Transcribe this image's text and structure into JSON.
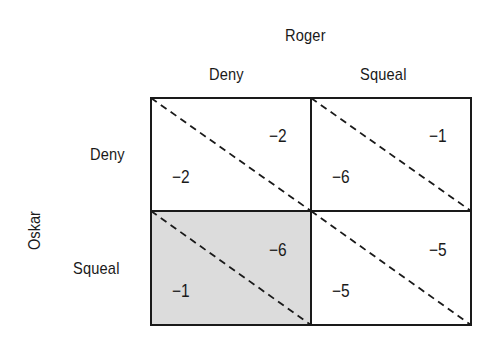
{
  "players": {
    "column_player": "Roger",
    "row_player": "Oskar"
  },
  "strategies": {
    "columns": [
      "Deny",
      "Squeal"
    ],
    "rows": [
      "Deny",
      "Squeal"
    ]
  },
  "payoffs": {
    "deny_deny": {
      "roger": "−2",
      "oskar": "−2"
    },
    "deny_squeal": {
      "roger": "−1",
      "oskar": "−6"
    },
    "squeal_deny": {
      "roger": "−6",
      "oskar": "−1"
    },
    "squeal_squeal": {
      "roger": "−5",
      "oskar": "−5"
    }
  },
  "highlight": {
    "cell": "squeal_deny",
    "color": "#dcdcdc"
  },
  "colors": {
    "line": "#1a1a1a",
    "background": "#ffffff"
  }
}
